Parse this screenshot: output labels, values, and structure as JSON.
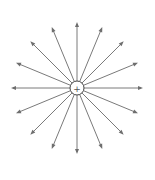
{
  "diagram": {
    "charge": {
      "sign": "+",
      "polarity": "positive"
    },
    "field_lines": {
      "count": 16,
      "direction": "outward",
      "angles_deg": [
        0,
        22.5,
        45,
        67.5,
        90,
        112.5,
        135,
        157.5,
        180,
        202.5,
        225,
        247.5,
        270,
        292.5,
        315,
        337.5
      ]
    },
    "colors": {
      "line": "#7a7a7a",
      "arrowhead": "#6e6e6e",
      "charge_outline": "#444444",
      "background": "#ffffff"
    }
  }
}
